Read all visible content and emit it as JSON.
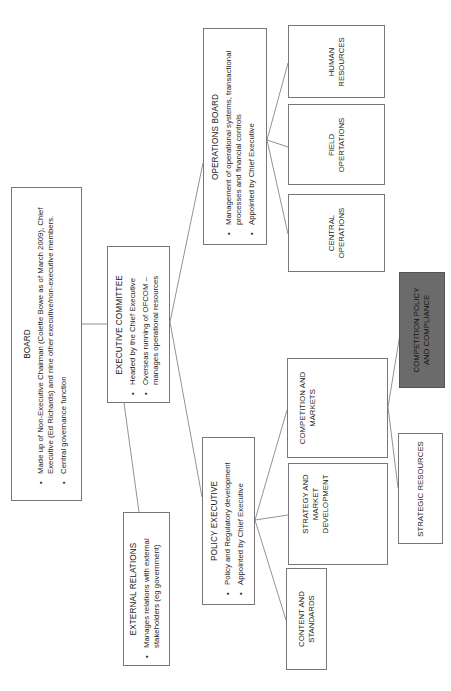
{
  "diagram": {
    "type": "org-chart",
    "orientation": "rotated-90-ccw",
    "colors": {
      "box_border": "#777777",
      "box_fill": "#ffffff",
      "highlight_fill": "#6b6b6b",
      "line": "#777777"
    },
    "nodes": {
      "board": {
        "title": "BOARD",
        "bullets": [
          "Made up of Non-Executive Chairman (Colette Bowe as of March 2009), Chief Executive (Ed Richards) and nine other executive/non-executive members.",
          "Central governance function"
        ]
      },
      "executive_committee": {
        "title": "EXECUTIVE COMMITTEE",
        "bullets": [
          "Headed by the Chief Executive",
          "Overseas running of OFCOM – manages operational resources"
        ]
      },
      "external_relations": {
        "title": "EXTERNAL RELATIONS",
        "bullets": [
          "Manages relations with external stakeholders (eg government)"
        ]
      },
      "operations_board": {
        "title": "OPERATIONS BOARD",
        "bullets": [
          "Management of operational systems, transactional processes and financial controls",
          "Appointed by Chief Executive"
        ]
      },
      "policy_executive": {
        "title": "POLICY EXECUTIVE",
        "bullets": [
          "Policy and Regulatory development",
          "Appointed by Chief Executive"
        ]
      },
      "human_resources": {
        "label": "HUMAN RESOURCES"
      },
      "field_operations": {
        "label": "FIELD OPERTATIONS"
      },
      "central_operations": {
        "label": "CENTRAL OPERATIONS"
      },
      "competition_and_markets": {
        "label": "COMPETITION AND MARKETS"
      },
      "strategy_and_market_development": {
        "label": "STRATEGY AND MARKET DEVELOPMENT"
      },
      "content_and_standards": {
        "label": "CONTENT AND STANDARDS"
      },
      "competition_policy_and_compliance": {
        "label": "COMPETITION POLICY AND COMPLIANCE",
        "highlighted": true
      },
      "strategic_resources": {
        "label": "STRATEGIC RESOURCES"
      }
    },
    "edges": [
      [
        "board",
        "executive_committee"
      ],
      [
        "executive_committee",
        "external_relations"
      ],
      [
        "executive_committee",
        "operations_board"
      ],
      [
        "executive_committee",
        "policy_executive"
      ],
      [
        "operations_board",
        "human_resources"
      ],
      [
        "operations_board",
        "field_operations"
      ],
      [
        "operations_board",
        "central_operations"
      ],
      [
        "policy_executive",
        "competition_and_markets"
      ],
      [
        "policy_executive",
        "strategy_and_market_development"
      ],
      [
        "policy_executive",
        "content_and_standards"
      ],
      [
        "competition_and_markets",
        "competition_policy_and_compliance"
      ],
      [
        "competition_and_markets",
        "strategic_resources"
      ]
    ]
  }
}
